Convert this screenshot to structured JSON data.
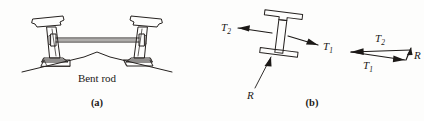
{
  "figure": {
    "type": "engineering-mechanics-figure",
    "background_color": "#fdfdfc",
    "ink_color": "#25211f"
  },
  "panel_a": {
    "part_label": "(a)",
    "caption": "Bent rod",
    "description": "Cross-section of two rails on a cambered roadbed joined by a horizontal bent rod tie",
    "components": {
      "left_rail": "rail-cross-section",
      "right_rail": "rail-cross-section",
      "tie_rod": "bent-rod",
      "roadbed": "ballast-peak-line"
    }
  },
  "panel_b": {
    "part_label": "(b)",
    "description": "Free body diagram of rail section with forces T1, T2 and resultant R, plus closing force triangle",
    "free_body": {
      "member": "i-beam-section",
      "forces": [
        {
          "name": "T_2",
          "symbol": "T",
          "subscript": "2",
          "direction": "left-up",
          "label": "T2"
        },
        {
          "name": "T_1",
          "symbol": "T",
          "subscript": "1",
          "direction": "right-down",
          "label": "T1"
        },
        {
          "name": "R",
          "symbol": "R",
          "subscript": "",
          "direction": "up-right",
          "label": "R"
        }
      ]
    },
    "force_triangle": {
      "title": "closing force triangle",
      "edges": [
        {
          "name": "T_2",
          "symbol": "T",
          "subscript": "2",
          "position": "top",
          "direction": "left"
        },
        {
          "name": "T_1",
          "symbol": "T",
          "subscript": "1",
          "position": "bottom-left",
          "direction": "right-down"
        },
        {
          "name": "R",
          "symbol": "R",
          "subscript": "",
          "position": "right",
          "direction": "up"
        }
      ]
    }
  },
  "labels": {
    "bent_rod": "Bent rod",
    "part_a": "(a)",
    "part_b": "(b)",
    "T": "T",
    "R": "R",
    "sub1": "1",
    "sub2": "2"
  }
}
